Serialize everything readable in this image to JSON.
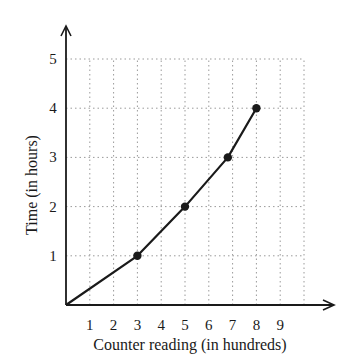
{
  "chart_data": {
    "type": "line",
    "title": "",
    "xlabel": "Counter reading (in hundreds)",
    "ylabel": "Time (in hours)",
    "x_ticks": [
      "1",
      "2",
      "3",
      "4",
      "5",
      "6",
      "7",
      "8",
      "9"
    ],
    "y_ticks": [
      "1",
      "2",
      "3",
      "4",
      "5"
    ],
    "xlim": [
      0,
      10
    ],
    "ylim": [
      0,
      5
    ],
    "grid": true,
    "grid_style": "dotted",
    "legend": null,
    "series": [
      {
        "name": "Time vs counter reading",
        "x": [
          0,
          3,
          5,
          6.8,
          8
        ],
        "y": [
          0,
          1,
          2,
          3,
          4
        ],
        "markers": [
          false,
          true,
          true,
          true,
          true
        ]
      }
    ],
    "colors": {
      "line": "#1a1a1a",
      "grid": "#9a9a9a",
      "axis": "#1a1a1a"
    }
  }
}
